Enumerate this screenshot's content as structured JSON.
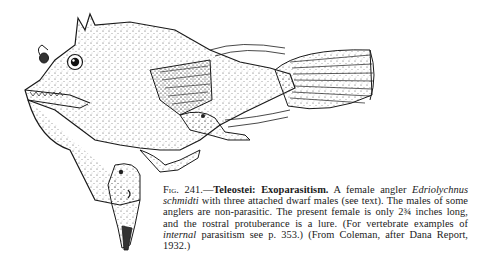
{
  "figure": {
    "number": "Fig. 241.—",
    "title": "Teleostei: Exoparasitism.",
    "caption_part1": " A female angler ",
    "species": "Edriolychnus schmidti",
    "caption_part2": " with three attached dwarf males (see text).  The males of some anglers are non-parasitic.  The present female is only 2¾ inches long, and the rostral protuberance is a lure.  (For vertebrate examples of ",
    "internal": "internal",
    "caption_part3": " parasitism see p. 353.)  (From Coleman, after Dana Report, 1932.)",
    "illustration": "anglerfish-female-with-three-dwarf-males-drawing",
    "ink_color": "#1a1a1a",
    "paper_color": "#ffffff"
  }
}
